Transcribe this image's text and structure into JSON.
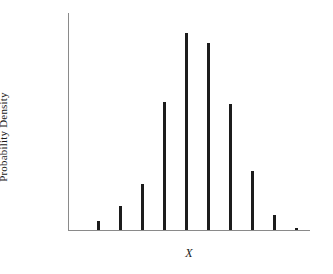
{
  "chart_data": {
    "type": "bar",
    "title": "",
    "subtitle": "",
    "xlabel": "X",
    "ylabel": "Probability Density",
    "grid": false,
    "legend": false,
    "legend_position": "none",
    "axis_color": "#8a8a8a",
    "bar_color": "#1c1c1c",
    "background_color": "#ffffff",
    "bar_width_px": 3,
    "xlim": [
      0,
      11
    ],
    "ylim": [
      0,
      1.0
    ],
    "tick_labels_shown": false,
    "categories": [
      "1",
      "2",
      "3",
      "4",
      "5",
      "6",
      "7",
      "8",
      "9",
      "10",
      "11"
    ],
    "values": [
      0.04,
      0.11,
      0.21,
      0.59,
      0.91,
      0.86,
      0.58,
      0.27,
      0.07,
      0.01,
      0.0
    ],
    "annotations": []
  },
  "axis_label_x": "X",
  "axis_label_y": "Probability Density"
}
